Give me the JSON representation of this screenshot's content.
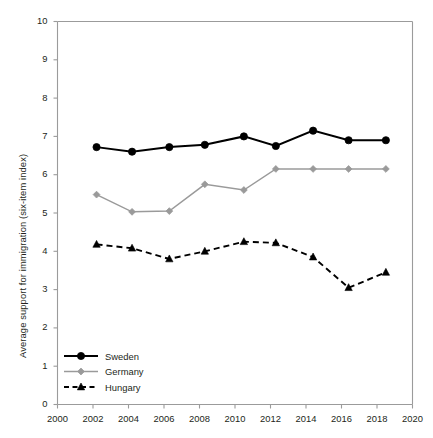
{
  "chart_data": {
    "type": "line",
    "title": "",
    "xlabel": "",
    "ylabel": "Average support for immigration (six-item index)",
    "xlim": [
      2000,
      2020
    ],
    "ylim": [
      0,
      10
    ],
    "xticks": [
      2000,
      2002,
      2004,
      2006,
      2008,
      2010,
      2012,
      2014,
      2016,
      2018,
      2020
    ],
    "yticks": [
      0,
      1,
      2,
      3,
      4,
      5,
      6,
      7,
      8,
      9,
      10
    ],
    "grid": false,
    "legend_position": "bottom-left",
    "x": [
      2002.2,
      2004.2,
      2006.3,
      2008.3,
      2010.5,
      2012.3,
      2014.4,
      2016.4,
      2018.5
    ],
    "series": [
      {
        "name": "Sweden",
        "color": "#000000",
        "marker": "circle",
        "linestyle": "solid",
        "values": [
          6.72,
          6.6,
          6.72,
          6.78,
          7.0,
          6.75,
          7.15,
          6.9,
          6.9
        ]
      },
      {
        "name": "Germany",
        "color": "#9a9a9a",
        "marker": "diamond",
        "linestyle": "solid",
        "values": [
          5.48,
          5.03,
          5.05,
          5.75,
          5.6,
          6.15,
          6.15,
          6.15,
          6.15
        ]
      },
      {
        "name": "Hungary",
        "color": "#000000",
        "marker": "triangle",
        "linestyle": "dashed",
        "values": [
          4.18,
          4.08,
          3.8,
          4.0,
          4.25,
          4.22,
          3.85,
          3.05,
          3.45
        ]
      }
    ]
  },
  "legend": {
    "items": [
      {
        "label": "Sweden"
      },
      {
        "label": "Germany"
      },
      {
        "label": "Hungary"
      }
    ]
  }
}
